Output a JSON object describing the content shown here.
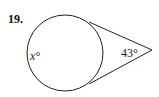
{
  "problem": {
    "number": "19.",
    "arc_label": "x°",
    "angle_label": "43°"
  },
  "figure": {
    "type": "circle with two tangents from external point",
    "circle": {
      "cx": 65,
      "cy": 53,
      "r": 38
    },
    "tangent_points": [
      [
        89,
        22
      ],
      [
        89,
        84
      ]
    ],
    "external_point": [
      152,
      50
    ],
    "stroke_color": "#222222"
  }
}
